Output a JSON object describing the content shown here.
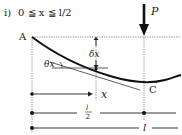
{
  "title": {
    "prefix": "i)",
    "condition": "0 ≦ x ≦ l/2"
  },
  "labels": {
    "point_a": "A",
    "point_c": "C",
    "load": "P",
    "deflection": "δx",
    "slope": "θx",
    "position": "x",
    "half_span_num": "l",
    "half_span_den": "2",
    "span": "l"
  },
  "colors": {
    "line": "#222222",
    "dotted": "#555555",
    "background": "#ffffff"
  }
}
